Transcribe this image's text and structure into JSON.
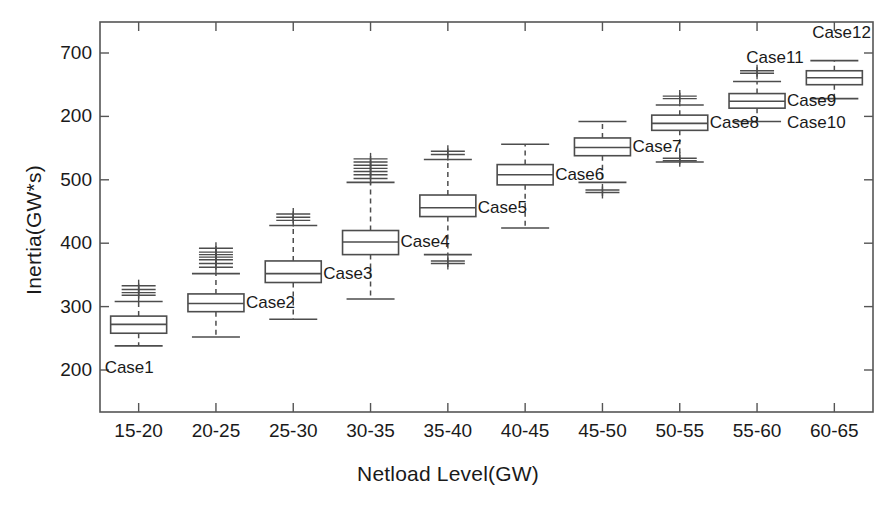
{
  "chart_data": {
    "type": "box",
    "title": "",
    "xlabel": "Netload Level(GW)",
    "ylabel": "Inertia(GW*s)",
    "categories": [
      "15-20",
      "20-25",
      "25-30",
      "30-35",
      "35-40",
      "40-45",
      "45-50",
      "50-55",
      "55-60",
      "60-65"
    ],
    "y_ticks": [
      {
        "label": "700",
        "value": 700
      },
      {
        "label": "200",
        "value": 600
      },
      {
        "label": "500",
        "value": 500
      },
      {
        "label": "400",
        "value": 400
      },
      {
        "label": "300",
        "value": 300
      },
      {
        "label": "200",
        "value": 200
      }
    ],
    "ylim": [
      150,
      740
    ],
    "xlim": [
      0.5,
      10.5
    ],
    "grid": false,
    "legend": false,
    "box_color": "#4d4d4d",
    "median_color": "#4d4d4d",
    "whisker_style": "dashed",
    "outlier_marker": "+",
    "boxes": [
      {
        "label": "Case1",
        "category": "15-20",
        "x": 1,
        "q1": 258,
        "median": 272,
        "q3": 285,
        "whisker_low": 238,
        "whisker_high": 308,
        "outliers": [
          318,
          322,
          327,
          333
        ],
        "label_pos": "below-left"
      },
      {
        "label": "Case2",
        "category": "20-25",
        "x": 2,
        "q1": 292,
        "median": 305,
        "q3": 320,
        "whisker_low": 252,
        "whisker_high": 352,
        "outliers": [
          362,
          368,
          374,
          378,
          382,
          386,
          392
        ],
        "label_pos": "right"
      },
      {
        "label": "Case3",
        "category": "25-30",
        "x": 3,
        "q1": 338,
        "median": 352,
        "q3": 372,
        "whisker_low": 280,
        "whisker_high": 428,
        "outliers": [
          436,
          441,
          446
        ],
        "label_pos": "right"
      },
      {
        "label": "Case4",
        "category": "30-35",
        "x": 4,
        "q1": 382,
        "median": 402,
        "q3": 420,
        "whisker_low": 312,
        "whisker_high": 496,
        "outliers": [
          502,
          508,
          513,
          518,
          523,
          528,
          533
        ],
        "label_pos": "right"
      },
      {
        "label": "Case5",
        "category": "35-40",
        "x": 5,
        "q1": 442,
        "median": 456,
        "q3": 476,
        "whisker_low": 382,
        "whisker_high": 532,
        "outliers": [
          368,
          372,
          540,
          545
        ],
        "label_pos": "right"
      },
      {
        "label": "Case6",
        "category": "40-45",
        "x": 6,
        "q1": 492,
        "median": 508,
        "q3": 524,
        "whisker_low": 424,
        "whisker_high": 556,
        "outliers": [],
        "label_pos": "right"
      },
      {
        "label": "Case7",
        "category": "45-50",
        "x": 7,
        "q1": 538,
        "median": 551,
        "q3": 566,
        "whisker_low": 496,
        "whisker_high": 592,
        "outliers": [
          480,
          484
        ],
        "label_pos": "right"
      },
      {
        "label": "Case8",
        "category": "50-55",
        "x": 8,
        "q1": 578,
        "median": 589,
        "q3": 602,
        "whisker_low": 528,
        "whisker_high": 618,
        "outliers": [
          530,
          534,
          628,
          632
        ],
        "label_pos": "right"
      },
      {
        "label": "Case9",
        "category": "55-60",
        "x": 9,
        "q1": 613,
        "median": 624,
        "q3": 636,
        "whisker_low": 592,
        "whisker_high": 655,
        "outliers": [
          668,
          672
        ],
        "label_pos": "right"
      },
      {
        "label": "Case10",
        "category": "55-60",
        "x": 9,
        "q1": 613,
        "median": 624,
        "q3": 636,
        "whisker_low": 592,
        "whisker_high": 655,
        "outliers": [],
        "label_pos": "right-low",
        "ghost": true
      },
      {
        "label": "Case11",
        "category": "60-65",
        "x": 10,
        "q1": 650,
        "median": 661,
        "q3": 672,
        "whisker_low": 628,
        "whisker_high": 688,
        "outliers": [],
        "label_pos": "left",
        "ghost": true
      },
      {
        "label": "Case12",
        "category": "60-65",
        "x": 10,
        "q1": 650,
        "median": 661,
        "q3": 672,
        "whisker_low": 628,
        "whisker_high": 688,
        "outliers": [],
        "label_pos": "above"
      }
    ]
  },
  "axis": {
    "x_title": "Netload Level(GW)",
    "y_title": "Inertia(GW*s)",
    "x_tick_labels": [
      "15-20",
      "20-25",
      "25-30",
      "30-35",
      "35-40",
      "40-45",
      "45-50",
      "50-55",
      "55-60",
      "60-65"
    ],
    "y_tick_labels": [
      "700",
      "200",
      "500",
      "400",
      "300",
      "200"
    ]
  }
}
